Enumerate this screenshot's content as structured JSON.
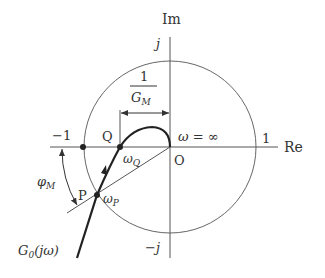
{
  "diagram": {
    "type": "nyquist-plot",
    "axes": {
      "real_label": "Re",
      "imag_label": "Im",
      "origin_label": "O"
    },
    "unit_circle": {
      "top_label": "j",
      "bottom_label": "−j",
      "left_label": "−1",
      "right_label": "1"
    },
    "points": {
      "Q": {
        "label": "Q",
        "freq_label_base": "ω",
        "freq_label_sub": "Q"
      },
      "P": {
        "label": "P",
        "freq_label_base": "ω",
        "freq_label_sub": "P"
      }
    },
    "omega_infinity_label": "ω = ∞",
    "gain_margin": {
      "numerator": "1",
      "denominator_base": "G",
      "denominator_sub": "M"
    },
    "phase_margin": {
      "base": "φ",
      "sub": "M"
    },
    "curve_label": {
      "base": "G",
      "sub": "0",
      "arg": "(jω)"
    },
    "colors": {
      "axis": "#555555",
      "curve": "#222222",
      "text": "#333333",
      "background": "#ffffff"
    }
  }
}
